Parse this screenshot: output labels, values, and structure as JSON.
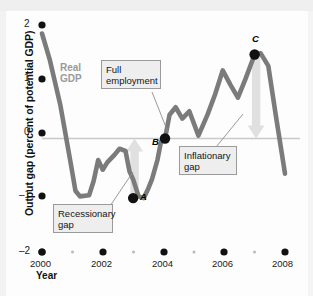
{
  "chart_data": {
    "type": "line",
    "title": "",
    "xlabel": "Year",
    "ylabel": "Output gap (percent of potential GDP)",
    "xlim": [
      2000,
      2008
    ],
    "ylim": [
      -2,
      2
    ],
    "yticks": [
      2,
      1,
      0,
      -1,
      -2
    ],
    "ytick_labels": [
      "2",
      "1",
      "0",
      "–1",
      "–2"
    ],
    "xticks": [
      2000,
      2002,
      2004,
      2006,
      2008
    ],
    "xtick_labels": [
      "2000",
      "2002",
      "2004",
      "2006",
      "2008"
    ],
    "xminor_ticks": [
      2001,
      2003,
      2005,
      2007
    ],
    "grid": false,
    "zero_line": 0,
    "legend": "none",
    "series": [
      {
        "name": "Real GDP",
        "color": "#7b7b7b",
        "x": [
          2000.0,
          2000.25,
          2000.6,
          2000.95,
          2001.1,
          2001.25,
          2001.55,
          2001.7,
          2001.85,
          2002.0,
          2002.15,
          2002.4,
          2002.55,
          2002.75,
          2002.88,
          2003.0,
          2003.18,
          2003.35,
          2003.5,
          2003.62,
          2003.8,
          2003.92,
          2004.05,
          2004.2,
          2004.4,
          2004.62,
          2004.85,
          2005.15,
          2005.45,
          2005.7,
          2005.95,
          2006.2,
          2006.45,
          2006.7,
          2007.0,
          2007.2,
          2007.45,
          2007.7,
          2008.0
        ],
        "y": [
          1.85,
          1.4,
          0.6,
          -0.45,
          -0.92,
          -1.02,
          -1.0,
          -0.75,
          -0.38,
          -0.55,
          -0.42,
          -0.28,
          -0.18,
          -0.22,
          -0.58,
          -0.72,
          -1.02,
          -1.05,
          -0.88,
          -0.72,
          -0.38,
          -0.05,
          0.0,
          0.42,
          0.55,
          0.35,
          0.48,
          0.05,
          0.42,
          0.78,
          1.2,
          0.95,
          0.72,
          1.05,
          1.48,
          1.5,
          1.28,
          0.4,
          -0.62
        ]
      }
    ],
    "points": [
      {
        "label": "A",
        "x": 2003.0,
        "y": -1.05,
        "note": "Recessionary gap trough"
      },
      {
        "label": "B",
        "x": 2004.05,
        "y": 0.0,
        "note": "Full employment"
      },
      {
        "label": "C",
        "x": 2007.0,
        "y": 1.48,
        "note": "Inflationary gap peak"
      }
    ],
    "annotations": [
      {
        "name": "full-employment",
        "text_lines": [
          "Full",
          "employment"
        ],
        "points_to": "B"
      },
      {
        "name": "recessionary-gap",
        "text_lines": [
          "Recessionary",
          "gap"
        ],
        "points_to": "A"
      },
      {
        "name": "inflationary-gap",
        "text_lines": [
          "Inflationary",
          "gap"
        ],
        "points_to": "C"
      },
      {
        "name": "series-label",
        "text_lines": [
          "Real",
          "GDP"
        ],
        "points_to": "series"
      }
    ],
    "arrows": [
      {
        "name": "recessionary-gap-arrow",
        "direction": "up",
        "from_y": -1.05,
        "to_y": 0.0,
        "x": 2003.05,
        "color": "#e0e0e0"
      },
      {
        "name": "inflationary-gap-arrow",
        "direction": "down",
        "from_y": 1.48,
        "to_y": 0.0,
        "x": 2007.05,
        "color": "#e0e0e0"
      }
    ]
  },
  "labels": {
    "y_axis_title": "Output gap (percent of potential GDP)",
    "x_axis_title": "Year",
    "series_name_line1": "Real",
    "series_name_line2": "GDP",
    "callout_full_employment_line1": "Full",
    "callout_full_employment_line2": "employment",
    "callout_recessionary_line1": "Recessionary",
    "callout_recessionary_line2": "gap",
    "callout_inflationary_line1": "Inflationary",
    "callout_inflationary_line2": "gap",
    "point_a": "A",
    "point_b": "B",
    "point_c": "C",
    "ytick_2": "2",
    "ytick_1": "1",
    "ytick_0": "0",
    "ytick_m1": "–1",
    "ytick_m2": "–2",
    "xtick_2000": "2000",
    "xtick_2002": "2002",
    "xtick_2004": "2004",
    "xtick_2006": "2006",
    "xtick_2008": "2008"
  },
  "colors": {
    "series": "#7b7b7b",
    "arrow": "#e2e2e2",
    "callout_bg": "#eeeeee",
    "callout_border": "#9a9a9a",
    "axis": "#c9c9c9",
    "text": "#111111",
    "series_label": "#9a9a9a"
  }
}
